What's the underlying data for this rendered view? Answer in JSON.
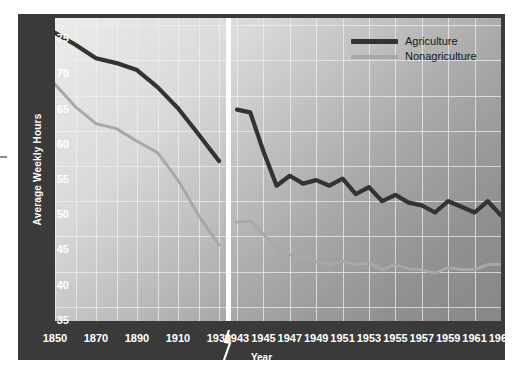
{
  "chart_data": {
    "type": "line",
    "title": "",
    "xlabel": "Year",
    "ylabel": "Average Weekly Hours",
    "ylim": [
      33,
      76
    ],
    "yticks": [
      35,
      40,
      45,
      50,
      55,
      60,
      65,
      70,
      75
    ],
    "grid": true,
    "legend_position": "top-right",
    "axis_break": {
      "present": true,
      "between": [
        "1930",
        "1943"
      ],
      "note": "scale changes from 20-year intervals to 2-year intervals"
    },
    "panels": [
      {
        "name": "left-panel-decades",
        "xticks": [
          "1850",
          "1870",
          "1890",
          "1910",
          "1930"
        ],
        "x": [
          1850,
          1860,
          1870,
          1880,
          1890,
          1900,
          1910,
          1920,
          1930
        ],
        "series": [
          {
            "name": "Agriculture",
            "values": [
              73.9,
              72.2,
              70.3,
              69.6,
              68.6,
              66.2,
              63.2,
              59.5,
              55.7
            ]
          },
          {
            "name": "Nonagriculture",
            "values": [
              66.6,
              63.4,
              61.0,
              60.3,
              58.5,
              56.9,
              53.0,
              48.0,
              43.8
            ]
          }
        ]
      },
      {
        "name": "right-panel-biennial",
        "xticks": [
          "1943",
          "1945",
          "1947",
          "1949",
          "1951",
          "1953",
          "1955",
          "1957",
          "1959",
          "1961",
          "1963"
        ],
        "x": [
          1943,
          1944,
          1945,
          1946,
          1947,
          1948,
          1949,
          1950,
          1951,
          1952,
          1953,
          1954,
          1955,
          1956,
          1957,
          1958,
          1959,
          1960,
          1961,
          1962,
          1963
        ],
        "series": [
          {
            "name": "Agriculture",
            "values": [
              63.0,
              62.6,
              57.1,
              52.2,
              53.6,
              52.5,
              53.0,
              52.2,
              53.2,
              51.0,
              52.0,
              50.0,
              50.9,
              49.8,
              49.4,
              48.4,
              50.0,
              49.2,
              48.4,
              50.0,
              48.0
            ]
          },
          {
            "name": "Nonagriculture",
            "values": [
              47.0,
              47.2,
              45.3,
              43.4,
              42.4,
              42.1,
              41.4,
              41.0,
              41.5,
              41.0,
              41.2,
              40.3,
              41.0,
              40.4,
              40.3,
              39.8,
              40.6,
              40.3,
              40.3,
              41.0,
              41.0
            ]
          }
        ]
      }
    ]
  },
  "axes": {
    "y_title": "Average Weekly Hours",
    "x_title": "Year",
    "y_tick_labels": [
      "75",
      "70",
      "65",
      "60",
      "55",
      "50",
      "45",
      "40",
      "35"
    ],
    "x_tick_labels": [
      "1850",
      "1870",
      "1890",
      "1910",
      "1930",
      "1943",
      "1945",
      "1947",
      "1949",
      "1951",
      "1953",
      "1955",
      "1957",
      "1959",
      "1961",
      "1963"
    ]
  },
  "legend": {
    "items": [
      {
        "label": "Agriculture",
        "color": "#333333"
      },
      {
        "label": "Nonagriculture",
        "color": "#a8a8a8"
      }
    ]
  },
  "colors": {
    "frame": "#3a3a3a",
    "agriculture": "#333333",
    "nonagriculture": "#a8a8a8",
    "gridline": "#f0f0f0",
    "break_line": "#ffffff",
    "tick_text": "#ffffff"
  }
}
